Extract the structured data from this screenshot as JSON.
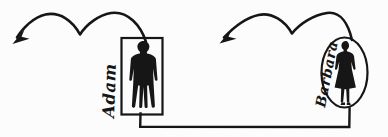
{
  "diagram": {
    "background_color": "#fcfcfc",
    "ink_color": "#161616",
    "figures": [
      {
        "name": "Adam",
        "frame_shape": "rectangle",
        "silhouette_icon": "man-silhouette-icon",
        "arrow_icon": "double-hop-curved-arrow-left-icon"
      },
      {
        "name": "Barbara",
        "frame_shape": "ellipse",
        "silhouette_icon": "woman-silhouette-icon",
        "arrow_icon": "double-hop-curved-arrow-left-icon"
      }
    ],
    "connector_icon": "bottom-bracket-connector-line"
  }
}
